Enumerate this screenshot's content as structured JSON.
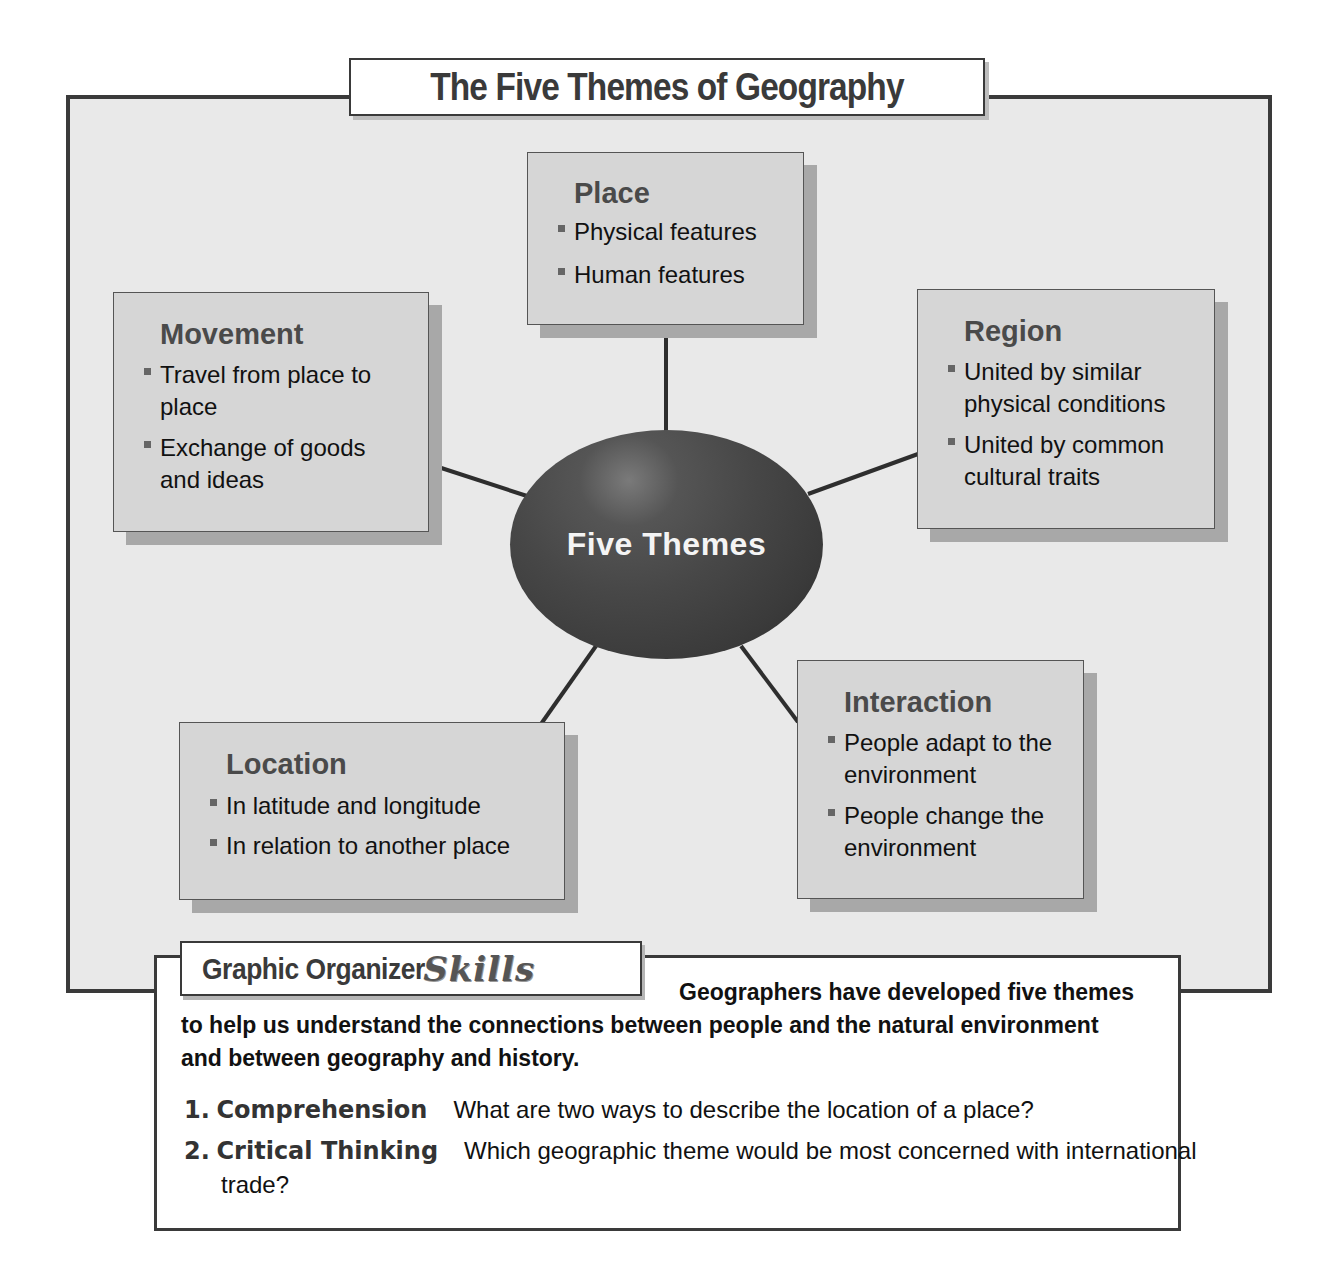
{
  "title": "The Five Themes of Geography",
  "hub": {
    "label": "Five Themes",
    "fill_color": "#3a3a3a"
  },
  "themes": {
    "place": {
      "title": "Place",
      "items": [
        "Physical features",
        "Human features"
      ]
    },
    "movement": {
      "title": "Movement",
      "items": [
        "Travel from place to place",
        "Exchange of goods and ideas"
      ]
    },
    "region": {
      "title": "Region",
      "items": [
        "United by similar physical conditions",
        "United by common cultural traits"
      ]
    },
    "location": {
      "title": "Location",
      "items": [
        "In latitude and longitude",
        "In relation to another place"
      ]
    },
    "interaction": {
      "title": "Interaction",
      "items": [
        "People adapt to the environment",
        "People change the environment"
      ]
    }
  },
  "skills": {
    "tab_title": "Graphic Organizer",
    "tab_script": "Skills",
    "intro": "Geographers have developed five themes to help us understand the connections between people and the natural environment and between geography and history.",
    "questions": [
      {
        "number": "1.",
        "label": "Comprehension",
        "text": "What are two ways to describe the location of a place?"
      },
      {
        "number": "2.",
        "label": "Critical Thinking",
        "text": "Which geographic theme would be most concerned with international trade?"
      }
    ]
  },
  "colors": {
    "panel_bg": "#e9e9e9",
    "box_bg": "#d6d6d6",
    "border": "#3a3a3a",
    "shadow": "#a8a8a8"
  }
}
